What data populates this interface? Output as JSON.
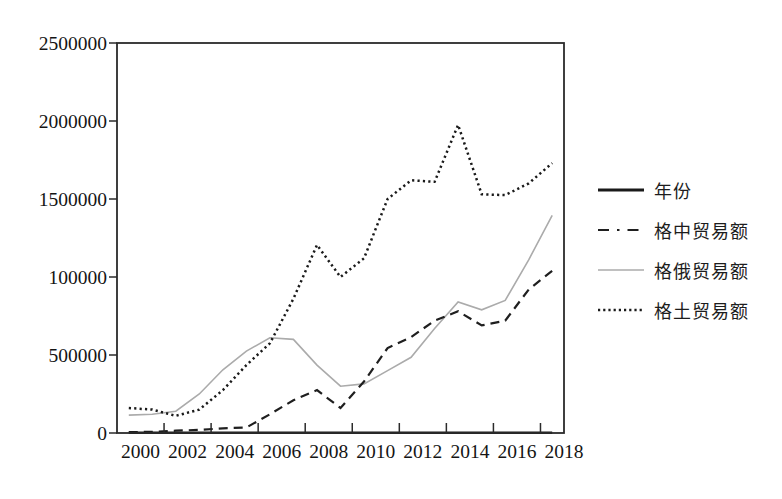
{
  "figure": {
    "background": "#ffffff",
    "axis_color": "#2b2b2b",
    "text_color": "#141414"
  },
  "chart_data": {
    "type": "line",
    "x": [
      2000,
      2001,
      2002,
      2003,
      2004,
      2005,
      2006,
      2007,
      2008,
      2009,
      2010,
      2011,
      2012,
      2013,
      2014,
      2015,
      2016,
      2017,
      2018
    ],
    "x_tick_labels": [
      "2000",
      "2002",
      "2004",
      "2006",
      "2008",
      "2010",
      "2012",
      "2014",
      "2016",
      "2018"
    ],
    "y_tick_labels": [
      "0",
      "500000",
      "100000",
      "1500000",
      "2000000",
      "2500000"
    ],
    "y_tick_values": [
      0,
      500000,
      1000000,
      1500000,
      2000000,
      2500000
    ],
    "ylim": [
      0,
      2500000
    ],
    "grid": false,
    "legend_position": "right",
    "series": [
      {
        "id": "year",
        "name": "年份",
        "style": "solid",
        "color": "#1a1a1a",
        "width": 2.4,
        "values": [
          2000,
          2001,
          2002,
          2003,
          2004,
          2005,
          2006,
          2007,
          2008,
          2009,
          2010,
          2011,
          2012,
          2013,
          2014,
          2015,
          2016,
          2017,
          2018
        ]
      },
      {
        "id": "georgia-china",
        "name": "格中贸易额",
        "style": "dashed",
        "color": "#1f1f1f",
        "width": 2.2,
        "values": [
          5000,
          8000,
          15000,
          20000,
          30000,
          35000,
          120000,
          210000,
          275000,
          160000,
          330000,
          545000,
          615000,
          720000,
          780000,
          690000,
          720000,
          920000,
          1040000
        ]
      },
      {
        "id": "georgia-russia",
        "name": "格俄贸易额",
        "style": "solid",
        "color": "#ababab",
        "width": 1.6,
        "values": [
          115000,
          120000,
          140000,
          250000,
          405000,
          525000,
          610000,
          600000,
          435000,
          300000,
          315000,
          400000,
          485000,
          670000,
          840000,
          790000,
          850000,
          1110000,
          1395000
        ]
      },
      {
        "id": "georgia-turkey",
        "name": "格土贸易额",
        "style": "dotted",
        "color": "#1a1a1a",
        "width": 2.5,
        "values": [
          160000,
          150000,
          110000,
          150000,
          275000,
          435000,
          575000,
          860000,
          1205000,
          1000000,
          1120000,
          1500000,
          1620000,
          1610000,
          1975000,
          1530000,
          1525000,
          1600000,
          1730000
        ]
      }
    ]
  }
}
